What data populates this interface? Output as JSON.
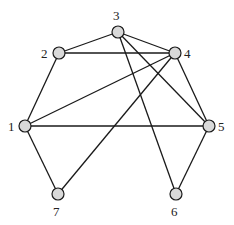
{
  "diagram": {
    "type": "graph",
    "nodes": [
      {
        "id": "1",
        "label": "1",
        "x": 25,
        "y": 126,
        "lx": 8,
        "ly": 131
      },
      {
        "id": "2",
        "label": "2",
        "x": 59,
        "y": 53,
        "lx": 41,
        "ly": 58
      },
      {
        "id": "3",
        "label": "3",
        "x": 118,
        "y": 32,
        "lx": 113,
        "ly": 20
      },
      {
        "id": "4",
        "label": "4",
        "x": 175,
        "y": 53,
        "lx": 184,
        "ly": 58
      },
      {
        "id": "5",
        "label": "5",
        "x": 209,
        "y": 126,
        "lx": 218,
        "ly": 131
      },
      {
        "id": "6",
        "label": "6",
        "x": 176,
        "y": 194,
        "lx": 171,
        "ly": 216
      },
      {
        "id": "7",
        "label": "7",
        "x": 58,
        "y": 194,
        "lx": 53,
        "ly": 216
      }
    ],
    "edges": [
      [
        "2",
        "3"
      ],
      [
        "3",
        "4"
      ],
      [
        "2",
        "4"
      ],
      [
        "3",
        "5"
      ],
      [
        "3",
        "6"
      ],
      [
        "4",
        "1"
      ],
      [
        "4",
        "7"
      ],
      [
        "4",
        "5"
      ],
      [
        "1",
        "2"
      ],
      [
        "1",
        "5"
      ],
      [
        "1",
        "7"
      ],
      [
        "5",
        "6"
      ]
    ],
    "node_fill": "#d9d9d9",
    "stroke": "#1a1a1a"
  }
}
